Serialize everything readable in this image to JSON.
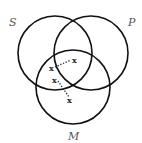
{
  "diagram": {
    "type": "venn-3-circle",
    "colors": {
      "stroke": "#111111",
      "label": "#555555",
      "background": "#ffffff"
    },
    "circles": [
      {
        "id": "S",
        "label": "S",
        "cx": 55,
        "cy": 53,
        "r": 37,
        "label_x": 12,
        "label_y": 26
      },
      {
        "id": "P",
        "label": "P",
        "cx": 91,
        "cy": 53,
        "r": 37,
        "label_x": 130,
        "label_y": 26
      },
      {
        "id": "M",
        "label": "M",
        "cx": 73,
        "cy": 87,
        "r": 37,
        "label_x": 73,
        "label_y": 140
      }
    ],
    "marks": [
      {
        "symbol": "x",
        "x": 74,
        "y": 61,
        "region": "S∩P∩M boundary (on S edge)"
      },
      {
        "symbol": "x",
        "x": 52,
        "y": 69,
        "region": "S∩M (outside P)"
      },
      {
        "symbol": "x",
        "x": 55,
        "y": 81,
        "region": "S∩M (on S edge)"
      },
      {
        "symbol": "x",
        "x": 70,
        "y": 101,
        "region": "M only"
      }
    ],
    "links": [
      {
        "from": 1,
        "to": 0,
        "style": "dotted"
      },
      {
        "from": 2,
        "to": 3,
        "style": "dotted"
      }
    ]
  }
}
